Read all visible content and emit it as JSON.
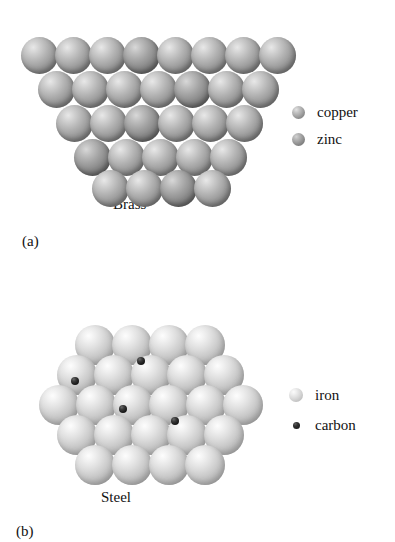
{
  "figure": {
    "panels": [
      {
        "id": "brass",
        "part_label": "(a)",
        "caption": "Brass",
        "legend": [
          {
            "label": "copper",
            "swatch": "copper-sphere-icon"
          },
          {
            "label": "zinc",
            "swatch": "zinc-sphere-icon"
          }
        ]
      },
      {
        "id": "steel",
        "part_label": "(b)",
        "caption": "Steel",
        "legend": [
          {
            "label": "iron",
            "swatch": "iron-sphere-icon"
          },
          {
            "label": "carbon",
            "swatch": "carbon-dot-icon"
          }
        ]
      }
    ]
  },
  "chart_data": {
    "type": "diagram",
    "subfigures": [
      {
        "name": "Brass",
        "label": "(a)",
        "alloy_type": "substitutional",
        "atom_diameter_px": 37,
        "rows": [
          {
            "y": 37,
            "x_start": 21,
            "count": 8,
            "species": [
              "copper",
              "copper",
              "copper",
              "zinc",
              "copper",
              "copper",
              "copper",
              "copper"
            ]
          },
          {
            "y": 71,
            "x_start": 38,
            "count": 7,
            "species": [
              "copper",
              "copper",
              "copper",
              "copper",
              "zinc",
              "copper",
              "copper"
            ]
          },
          {
            "y": 105,
            "x_start": 56,
            "count": 6,
            "species": [
              "copper",
              "copper",
              "zinc",
              "copper",
              "copper",
              "copper"
            ]
          },
          {
            "y": 139,
            "x_start": 74,
            "count": 5,
            "species": [
              "zinc",
              "copper",
              "copper",
              "copper",
              "copper"
            ]
          },
          {
            "y": 170,
            "x_start": 92,
            "count": 4,
            "species": [
              "copper",
              "copper",
              "zinc",
              "copper"
            ]
          }
        ],
        "total_atoms": 30,
        "copper_count": 25,
        "zinc_count": 5
      },
      {
        "name": "Steel",
        "label": "(b)",
        "alloy_type": "interstitial",
        "atom_diameter_px": 40,
        "rows": [
          {
            "y": 325,
            "x_start": 75,
            "count": 4,
            "species": [
              "iron",
              "iron",
              "iron",
              "iron"
            ]
          },
          {
            "y": 355,
            "x_start": 57,
            "count": 5,
            "species": [
              "iron",
              "iron",
              "iron",
              "iron",
              "iron"
            ]
          },
          {
            "y": 385,
            "x_start": 39,
            "count": 6,
            "species": [
              "iron",
              "iron",
              "iron",
              "iron",
              "iron",
              "iron"
            ]
          },
          {
            "y": 415,
            "x_start": 57,
            "count": 5,
            "species": [
              "iron",
              "iron",
              "iron",
              "iron",
              "iron"
            ]
          },
          {
            "y": 445,
            "x_start": 75,
            "count": 4,
            "species": [
              "iron",
              "iron",
              "iron",
              "iron"
            ]
          }
        ],
        "iron_count": 24,
        "carbon_count": 4,
        "carbon_positions": [
          {
            "cx": 141,
            "cy": 361,
            "d": 8
          },
          {
            "cx": 75,
            "cy": 381,
            "d": 8
          },
          {
            "cx": 123,
            "cy": 409,
            "d": 8
          },
          {
            "cx": 175,
            "cy": 421,
            "d": 8
          }
        ]
      }
    ],
    "colors": {
      "copper": "#9a9a9a",
      "zinc": "#898989",
      "iron": "#cbcbcb",
      "carbon": "#121212",
      "background": "#ffffff",
      "text": "#111111"
    }
  }
}
